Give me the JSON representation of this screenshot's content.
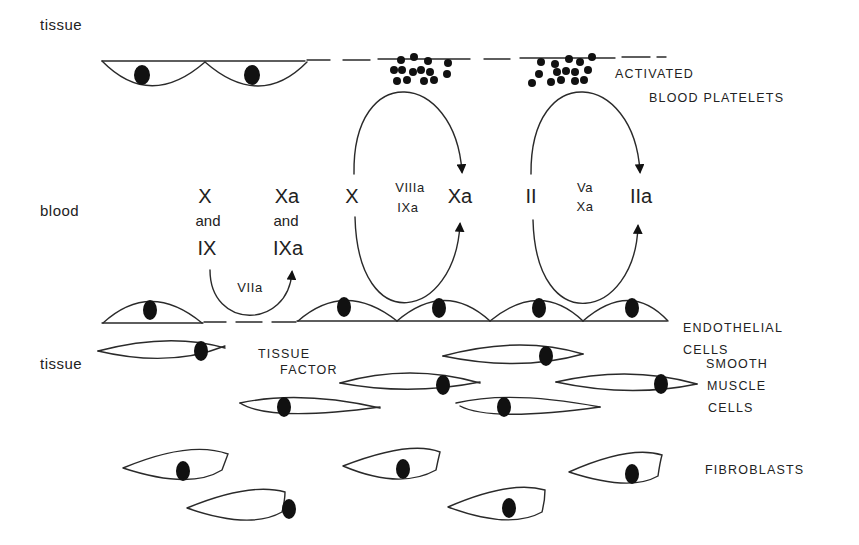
{
  "regions": {
    "tissue_top": "tissue",
    "blood": "blood",
    "tissue_bottom": "tissue"
  },
  "labels": {
    "activated": "ACTIVATED",
    "blood_platelets": "BLOOD PLATELETS",
    "endothelial": "ENDOTHELIAL",
    "endothelial_cells": "CELLS",
    "tissue_factor_1": "TISSUE",
    "tissue_factor_2": "FACTOR",
    "smooth": "SMOOTH",
    "muscle": "MUSCLE",
    "smooth_cells": "CELLS",
    "fibroblasts": "FIBROBLASTS"
  },
  "extrinsic": {
    "left_top": "X",
    "left_and": "and",
    "left_bottom": "IX",
    "right_top": "Xa",
    "right_and": "and",
    "right_bottom": "IXa",
    "enzyme": "VIIa"
  },
  "tenase_loop": {
    "substrate": "X",
    "cofactor": "VIIIa",
    "enzyme": "IXa",
    "product": "Xa"
  },
  "prothrombinase_loop": {
    "substrate": "II",
    "cofactor": "Va",
    "enzyme": "Xa",
    "product": "IIa"
  }
}
